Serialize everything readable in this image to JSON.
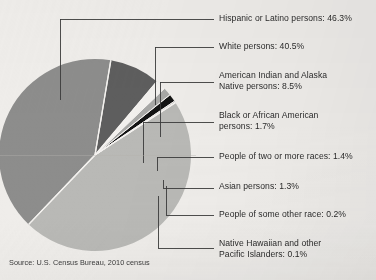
{
  "figure": {
    "source_note": "Source: U.S. Census Bureau, 2010 census",
    "background_color": "#efedea",
    "text_color": "#2b2b2b"
  },
  "chart_data": {
    "type": "pie",
    "title": "",
    "subtitle": "",
    "xlabel": "",
    "ylabel": "",
    "grid": false,
    "legend_position": "callout-labels-right",
    "units": "percent",
    "start_angle_deg": -33,
    "direction": "clockwise",
    "center": [
      95,
      155
    ],
    "radius": 96,
    "categories": [
      "Hispanic or Latino persons",
      "White persons",
      "American Indian and Alaska Native persons",
      "Black or African American persons",
      "People of two or more races",
      "Asian persons",
      "People of some other race",
      "Native Hawaiian and other Pacific Islanders"
    ],
    "values": [
      46.3,
      40.5,
      8.5,
      1.7,
      1.4,
      1.3,
      0.2,
      0.1
    ],
    "colors": [
      "#b9b9b6",
      "#8d8d8c",
      "#5e5e5e",
      "#f2f0ed",
      "#a8a8a6",
      "#141414",
      "#6f6f6f",
      "#cfcfcd"
    ],
    "slices": [
      {
        "label": "Hispanic or Latino persons",
        "value": 46.3,
        "value_text": "46.3%",
        "color": "#b9b9b6"
      },
      {
        "label": "White persons",
        "value": 40.5,
        "value_text": "40.5%",
        "color": "#8d8d8c"
      },
      {
        "label": "American Indian and Alaska Native persons",
        "value": 8.5,
        "value_text": "8.5%",
        "color": "#5e5e5e"
      },
      {
        "label": "Black or African American persons",
        "value": 1.7,
        "value_text": "1.7%",
        "color": "#f2f0ed"
      },
      {
        "label": "People of two or more races",
        "value": 1.4,
        "value_text": "1.4%",
        "color": "#a8a8a6"
      },
      {
        "label": "Asian persons",
        "value": 1.3,
        "value_text": "1.3%",
        "color": "#141414"
      },
      {
        "label": "People of some other race",
        "value": 0.2,
        "value_text": "0.2%",
        "color": "#6f6f6f"
      },
      {
        "label": "Native Hawaiian and other Pacific Islanders",
        "value": 0.1,
        "value_text": "0.1%",
        "color": "#cfcfcd"
      }
    ]
  },
  "callouts": [
    {
      "text": "Hispanic or Latino persons: 46.3%"
    },
    {
      "text": "White persons: 40.5%"
    },
    {
      "text": "American Indian and Alaska\nNative persons: 8.5%"
    },
    {
      "text": "Black or African American\npersons: 1.7%"
    },
    {
      "text": "People of two or more races: 1.4%"
    },
    {
      "text": "Asian persons: 1.3%"
    },
    {
      "text": "People of some other race: 0.2%"
    },
    {
      "text": "Native Hawaiian and other\nPacific Islanders: 0.1%"
    }
  ]
}
